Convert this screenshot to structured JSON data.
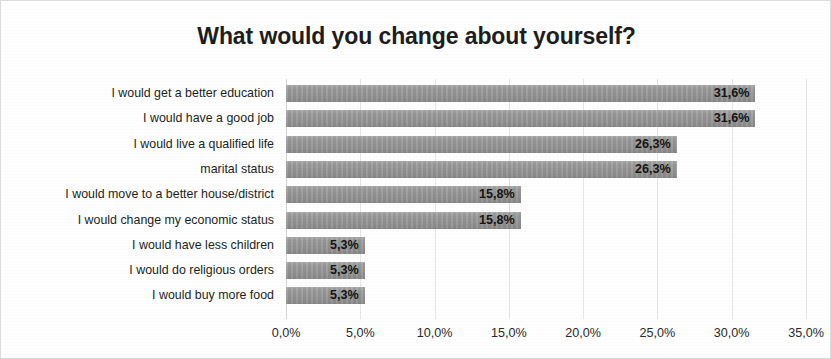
{
  "chart_data": {
    "type": "bar",
    "orientation": "horizontal",
    "title": "What would you change about yourself?",
    "xlabel": "",
    "ylabel": "",
    "xlim": [
      0,
      35
    ],
    "grid": true,
    "legend": "none",
    "decimal_separator": ",",
    "unit": "%",
    "bar_color": "#9b9b9b",
    "categories": [
      "I would get a better education",
      "I would have a good job",
      "I would live a qualified life",
      "marital status",
      "I would move to a better house/district",
      "I would change my economic status",
      "I would have less children",
      "I would do religious orders",
      "I would buy more food"
    ],
    "values": [
      31.6,
      31.6,
      26.3,
      26.3,
      15.8,
      15.8,
      5.3,
      5.3,
      5.3
    ],
    "value_labels": [
      "31,6%",
      "31,6%",
      "26,3%",
      "26,3%",
      "15,8%",
      "15,8%",
      "5,3%",
      "5,3%",
      "5,3%"
    ],
    "xticks": [
      0,
      5,
      10,
      15,
      20,
      25,
      30,
      35
    ],
    "xtick_labels": [
      "0,0%",
      "5,0%",
      "10,0%",
      "15,0%",
      "20,0%",
      "25,0%",
      "30,0%",
      "35,0%"
    ]
  }
}
